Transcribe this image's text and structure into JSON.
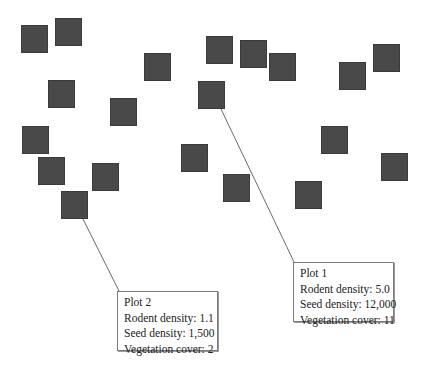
{
  "diagram": {
    "square_color": "#494949",
    "squares": [
      {
        "x": 21,
        "y": 25
      },
      {
        "x": 55,
        "y": 18
      },
      {
        "x": 144,
        "y": 53
      },
      {
        "x": 48,
        "y": 80
      },
      {
        "x": 110,
        "y": 98
      },
      {
        "x": 22,
        "y": 126
      },
      {
        "x": 38,
        "y": 157
      },
      {
        "x": 92,
        "y": 163
      },
      {
        "x": 61,
        "y": 191
      },
      {
        "x": 181,
        "y": 144
      },
      {
        "x": 206,
        "y": 36
      },
      {
        "x": 198,
        "y": 81
      },
      {
        "x": 240,
        "y": 40
      },
      {
        "x": 269,
        "y": 53
      },
      {
        "x": 223,
        "y": 174
      },
      {
        "x": 339,
        "y": 62
      },
      {
        "x": 373,
        "y": 44
      },
      {
        "x": 321,
        "y": 126
      },
      {
        "x": 381,
        "y": 153
      },
      {
        "x": 295,
        "y": 181
      }
    ],
    "callouts": [
      {
        "id": "plot-2",
        "title": "Plot 2",
        "rodent_density": "Rodent density: 1.1",
        "seed_density": "Seed density: 1,500",
        "vegetation_cover": "Vegetation cover: 2"
      },
      {
        "id": "plot-1",
        "title": "Plot 1",
        "rodent_density": "Rodent density: 5.0",
        "seed_density": "Seed density: 12,000",
        "vegetation_cover": "Vegetation cover: 11"
      }
    ]
  }
}
